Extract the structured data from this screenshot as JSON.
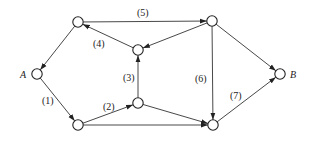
{
  "diagram": {
    "type": "directed-network",
    "nodes": [
      {
        "id": "A",
        "label": "A",
        "x": 37,
        "y": 74
      },
      {
        "id": "N1",
        "label": "",
        "x": 78,
        "y": 22
      },
      {
        "id": "N2",
        "label": "",
        "x": 212,
        "y": 21
      },
      {
        "id": "N3",
        "label": "",
        "x": 138,
        "y": 50
      },
      {
        "id": "N4",
        "label": "",
        "x": 138,
        "y": 103
      },
      {
        "id": "N5",
        "label": "",
        "x": 78,
        "y": 125
      },
      {
        "id": "N6",
        "label": "",
        "x": 213,
        "y": 125
      },
      {
        "id": "B",
        "label": "B",
        "x": 280,
        "y": 74
      }
    ],
    "edges": [
      {
        "from": "A",
        "to": "N5",
        "label": "(1)",
        "lx": 42,
        "ly": 104
      },
      {
        "from": "N5",
        "to": "N4",
        "label": "(2)",
        "lx": 103,
        "ly": 110
      },
      {
        "from": "N4",
        "to": "N3",
        "label": "(3)",
        "lx": 123,
        "ly": 81
      },
      {
        "from": "N3",
        "to": "N1",
        "label": "(4)",
        "lx": 93,
        "ly": 47
      },
      {
        "from": "N1",
        "to": "N2",
        "label": "(5)",
        "lx": 137,
        "ly": 16
      },
      {
        "from": "N2",
        "to": "N6",
        "label": "(6)",
        "lx": 195,
        "ly": 82
      },
      {
        "from": "N6",
        "to": "B",
        "label": "(7)",
        "lx": 230,
        "ly": 99
      },
      {
        "from": "N1",
        "to": "A",
        "label": ""
      },
      {
        "from": "N2",
        "to": "N3",
        "label": ""
      },
      {
        "from": "N2",
        "to": "B",
        "label": ""
      },
      {
        "from": "N4",
        "to": "N6",
        "label": ""
      },
      {
        "from": "N5",
        "to": "N6",
        "label": ""
      }
    ]
  }
}
